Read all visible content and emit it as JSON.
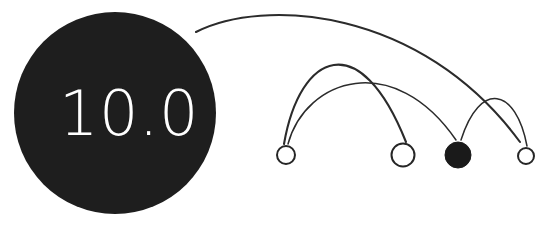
{
  "canvas": {
    "width": 559,
    "height": 250,
    "background": "#ffffff"
  },
  "palette": {
    "node_fill": "#1a1a1a",
    "node_stroke": "#262626",
    "edge_stroke": "#2b2b2b",
    "hub_fill": "#1e1e1e",
    "hub_text": "#ffffff",
    "open_node_fill": "#ffffff"
  },
  "chart_data": {
    "type": "scatter",
    "title": "",
    "subtitle": "",
    "xlabel": "",
    "ylabel": "",
    "grid": false,
    "legend": null,
    "baseline_y": 155,
    "nodes": [
      {
        "id": "hub",
        "label": "10.0",
        "cx": 115,
        "cy": 113,
        "r": 101,
        "style": "filled",
        "fill": "#1e1e1e",
        "text_color": "#ffffff",
        "font_size": 62
      },
      {
        "id": "n1",
        "label": "",
        "cx": 286,
        "cy": 155,
        "r": 9,
        "style": "open",
        "fill": "#ffffff",
        "stroke": "#262626",
        "stroke_width": 2
      },
      {
        "id": "n2",
        "label": "",
        "cx": 403,
        "cy": 155,
        "r": 11.5,
        "style": "open",
        "fill": "#ffffff",
        "stroke": "#262626",
        "stroke_width": 2
      },
      {
        "id": "n3",
        "label": "",
        "cx": 458,
        "cy": 155,
        "r": 13,
        "style": "filled",
        "fill": "#1a1a1a",
        "stroke": "#1a1a1a",
        "stroke_width": 1
      },
      {
        "id": "n4",
        "label": "",
        "cx": 526,
        "cy": 156,
        "r": 8,
        "style": "open",
        "fill": "#ffffff",
        "stroke": "#262626",
        "stroke_width": 2
      }
    ],
    "edges": [
      {
        "id": "e1",
        "source": "hub",
        "target": "n4",
        "path": "M 196,32 C 262,-2 420,6 520,142",
        "stroke_width": 2.1
      },
      {
        "id": "e2",
        "source": "n1",
        "target": "n2",
        "path": "M 284,144 C 300,52 360,26 406,142",
        "stroke_width": 2.1
      },
      {
        "id": "e3",
        "source": "n1",
        "target": "n3",
        "path": "M 288,144 C 306,78 394,50 456,140",
        "stroke_width": 1.5
      },
      {
        "id": "e4",
        "source": "n3",
        "target": "n4",
        "path": "M 461,140 C 480,80 516,88 527,146",
        "stroke_width": 1.5
      }
    ]
  }
}
